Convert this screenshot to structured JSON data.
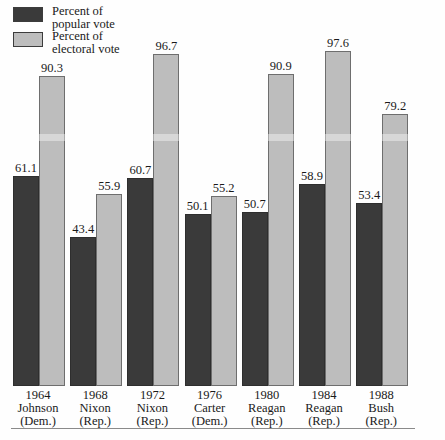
{
  "legend": {
    "items": [
      {
        "name": "popular",
        "line1": "Percent of",
        "line2": "popular vote",
        "color": "#3a3a3a"
      },
      {
        "name": "electoral",
        "line1": "Percent of",
        "line2": "electoral vote",
        "color": "#bdbdbd"
      }
    ]
  },
  "chart_data": {
    "type": "bar",
    "title": "",
    "xlabel": "",
    "ylabel": "",
    "ylim": [
      0,
      100
    ],
    "grid": false,
    "legend_position": "top-left",
    "categories": [
      "1964",
      "1968",
      "1972",
      "1976",
      "1980",
      "1984",
      "1988"
    ],
    "category_labels": [
      {
        "year": "1964",
        "name": "Johnson",
        "party": "(Dem.)"
      },
      {
        "year": "1968",
        "name": "Nixon",
        "party": "(Rep.)"
      },
      {
        "year": "1972",
        "name": "Nixon",
        "party": "(Rep.)"
      },
      {
        "year": "1976",
        "name": "Carter",
        "party": "(Dem.)"
      },
      {
        "year": "1980",
        "name": "Reagan",
        "party": "(Rep.)"
      },
      {
        "year": "1984",
        "name": "Reagan",
        "party": "(Rep.)"
      },
      {
        "year": "1988",
        "name": "Bush",
        "party": "(Rep.)"
      }
    ],
    "series": [
      {
        "name": "Percent of popular vote",
        "color": "#3a3a3a",
        "values": [
          61.1,
          43.4,
          60.7,
          50.1,
          50.7,
          58.9,
          53.4
        ]
      },
      {
        "name": "Percent of electoral vote",
        "color": "#bdbdbd",
        "values": [
          90.3,
          55.9,
          96.7,
          55.2,
          90.9,
          97.6,
          79.2
        ]
      }
    ]
  }
}
